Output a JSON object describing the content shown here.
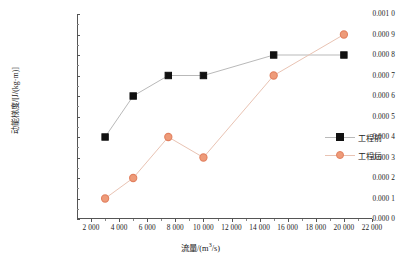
{
  "chart_data": {
    "type": "line",
    "title": "",
    "xlabel": "流量/(m³/s)",
    "ylabel": "动能梯度/[J/(kg·m)]",
    "xlim": [
      1000,
      22000
    ],
    "ylim": [
      0,
      0.001
    ],
    "grid": false,
    "legend_position": "right",
    "x_ticks": [
      2000,
      4000,
      6000,
      8000,
      10000,
      12000,
      14000,
      16000,
      18000,
      20000,
      22000
    ],
    "x_tick_labels": [
      "2 000",
      "4 000",
      "6 000",
      "8 000",
      "10 000",
      "12 000",
      "14 000",
      "16 000",
      "18 000",
      "20 000",
      "22 000"
    ],
    "y_ticks": [
      0,
      0.0001,
      0.0002,
      0.0003,
      0.0004,
      0.0005,
      0.0006,
      0.0007,
      0.0008,
      0.0009,
      0.001
    ],
    "y_tick_labels": [
      "0.000 0",
      "0.000 1",
      "0.000 2",
      "0.000 3",
      "0.000 4",
      "0.000 5",
      "0.000 6",
      "0.000 7",
      "0.000 8",
      "0.000 9",
      "0.001 0"
    ],
    "series": [
      {
        "name": "工程前",
        "marker": "square",
        "color": "#111111",
        "line_color": "#b9b9b9",
        "x": [
          3000,
          5000,
          7500,
          10000,
          15000,
          20000
        ],
        "y": [
          0.0004,
          0.0006,
          0.0007,
          0.0007,
          0.0008,
          0.0008
        ]
      },
      {
        "name": "工程后",
        "marker": "circle",
        "color": "#e2805f",
        "fill": "#ee9b79",
        "line_color": "#e9c3b3",
        "x": [
          3000,
          5000,
          7500,
          10000,
          15000,
          20000
        ],
        "y": [
          0.0001,
          0.0002,
          0.0004,
          0.0003,
          0.0007,
          0.0009
        ]
      }
    ]
  },
  "legend": {
    "items": [
      {
        "label": "工程前"
      },
      {
        "label": "工程后"
      }
    ]
  },
  "axes": {
    "x_title_prefix": "流量/(m",
    "x_title_sup": "3",
    "x_title_suffix": "/s)",
    "y_title": "动能梯度/[J/(kg·m)]"
  }
}
